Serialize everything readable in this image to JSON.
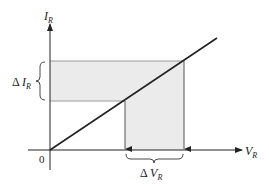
{
  "diagram": {
    "title": "",
    "y_axis": {
      "label_main": "I",
      "label_sub": "R"
    },
    "x_axis": {
      "label_main": "V",
      "label_sub": "R"
    },
    "origin_label": "0",
    "delta_i": {
      "prefix": "Δ ",
      "main": "I",
      "sub": "R"
    },
    "delta_v": {
      "prefix": "Δ ",
      "main": "V",
      "sub": "R"
    },
    "colors": {
      "line": "#222222",
      "shade": "#ebebeb",
      "guide": "#9a9a9a"
    }
  }
}
